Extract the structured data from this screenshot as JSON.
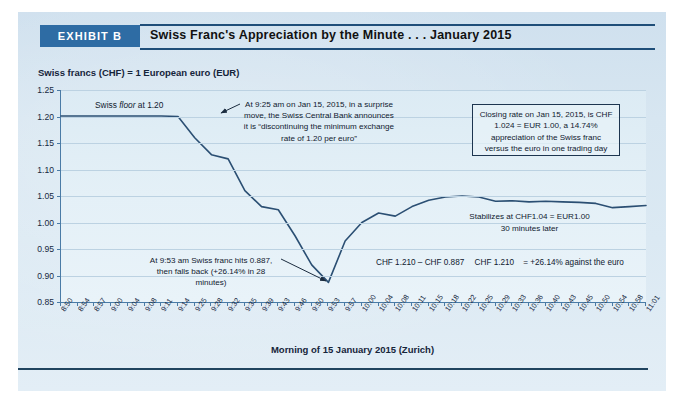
{
  "header": {
    "exhibit_tag": "EXHIBIT B",
    "title": "Swiss Franc's Appreciation by the Minute . . . January 2015"
  },
  "colors": {
    "tag_background": "#2e6ca4",
    "rule": "#1f4e79",
    "line": "#2b4f73",
    "panel": "#d7e6f1",
    "plot_background": "#e2eef6",
    "grid": "#bcd2e2"
  },
  "annotations": {
    "floor": {
      "prefix": "Swiss ",
      "emphasis": "floor",
      "suffix": " at 1.20"
    },
    "snb_announcement": "At 9:25 am on Jan 15, 2015, in a surprise move, the Swiss Central Bank announces it is “discontinuing the minimum exchange rate of 1.20 per euro”",
    "closing_box": "Closing rate on Jan 15, 2015, is CHF 1.024 = EUR 1.00, a 14.74% appreciation of the Swiss franc versus the euro in one trading day",
    "trough": "At 9:53 am Swiss franc hits 0.887, then falls back (+26.14% in 28 minutes)",
    "stabilizes": "Stabilizes at CHF1.04 = EUR1.00\n30 minutes later",
    "stabilizes_line1": "Stabilizes at CHF1.04 = EUR1.00",
    "stabilizes_line2": "30 minutes later",
    "formula": {
      "numerator": "CHF 1.210 – CHF 0.887",
      "denominator": "CHF 1.210",
      "result": "= +26.14% against the euro"
    }
  },
  "chart_data": {
    "type": "line",
    "title": "Swiss Franc's Appreciation by the Minute . . . January 2015",
    "subtitle": "",
    "ylabel": "Swiss francs (CHF) = 1 European euro (EUR)",
    "xlabel": "Morning of 15 January 2015 (Zurich)",
    "ylim": [
      0.85,
      1.25
    ],
    "ytick_labels": [
      "1.25",
      "1.20",
      "1.15",
      "1.10",
      "1.05",
      "1.00",
      "0.95",
      "0.90",
      "0.85"
    ],
    "yticks": [
      1.25,
      1.2,
      1.15,
      1.1,
      1.05,
      1.0,
      0.95,
      0.9,
      0.85
    ],
    "grid": true,
    "legend": "none",
    "categories": [
      "8:50",
      "8:54",
      "8:57",
      "9:00",
      "9:04",
      "9:08",
      "9:11",
      "9:14",
      "9:25",
      "9:28",
      "9:32",
      "9:35",
      "9:39",
      "9:43",
      "9:46",
      "9:50",
      "9:53",
      "9:57",
      "10:00",
      "10:04",
      "10:08",
      "10:11",
      "10:15",
      "10:18",
      "10:22",
      "10:25",
      "10:29",
      "10:33",
      "10:36",
      "10:40",
      "10:43",
      "10:45",
      "10:50",
      "10:54",
      "10:58",
      "11:01"
    ],
    "series": [
      {
        "name": "CHF per EUR",
        "values": [
          1.201,
          1.201,
          1.201,
          1.201,
          1.201,
          1.201,
          1.201,
          1.2,
          1.16,
          1.128,
          1.12,
          1.06,
          1.03,
          1.024,
          0.975,
          0.92,
          0.887,
          0.965,
          1.0,
          1.018,
          1.012,
          1.03,
          1.042,
          1.048,
          1.05,
          1.048,
          1.04,
          1.041,
          1.039,
          1.04,
          1.039,
          1.038,
          1.036,
          1.028,
          1.03,
          1.032
        ]
      }
    ],
    "key_points": {
      "floor": 1.2,
      "trough": 0.887,
      "trough_time": "9:53",
      "closing_rate": 1.024,
      "stabilized": 1.04,
      "appreciation_intraday_pct": 26.14,
      "appreciation_day_pct": 14.74
    }
  }
}
